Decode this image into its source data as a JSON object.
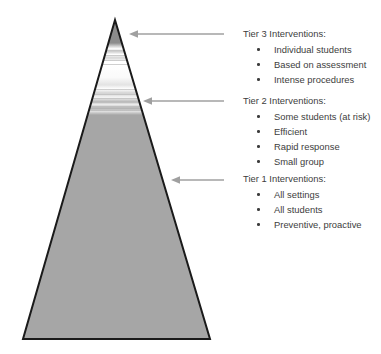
{
  "diagram": {
    "shape": "triangle-pyramid",
    "colors": {
      "pyramid_outline": "#1a1a1a",
      "tier1_fill": "#a6a6a6",
      "tier3_fill": "#8c8c8c",
      "tier2_fill": "#ffffff",
      "arrow": "#a0a0a0",
      "text": "#3d3d3d",
      "background": "#ffffff"
    },
    "geometry": {
      "apex_x": 115,
      "apex_y": 20,
      "base_left_x": 23,
      "base_right_x": 210,
      "base_y": 339
    }
  },
  "arrows": [
    {
      "name": "arrow-tier3",
      "direction": "left",
      "points_to": "tier-3-band"
    },
    {
      "name": "arrow-tier2",
      "direction": "left",
      "points_to": "tier-2-band"
    },
    {
      "name": "arrow-tier1",
      "direction": "left",
      "points_to": "tier-1-band"
    }
  ],
  "tiers": [
    {
      "id": "tier3",
      "heading": "Tier 3 Interventions:",
      "items": [
        "Individual students",
        "Based on assessment",
        "Intense procedures"
      ]
    },
    {
      "id": "tier2",
      "heading": "Tier 2 Interventions:",
      "items": [
        "Some students (at risk)",
        "Efficient",
        "Rapid response",
        "Small group"
      ]
    },
    {
      "id": "tier1",
      "heading": "Tier 1 Interventions:",
      "items": [
        "All settings",
        "All students",
        "Preventive, proactive"
      ]
    }
  ]
}
